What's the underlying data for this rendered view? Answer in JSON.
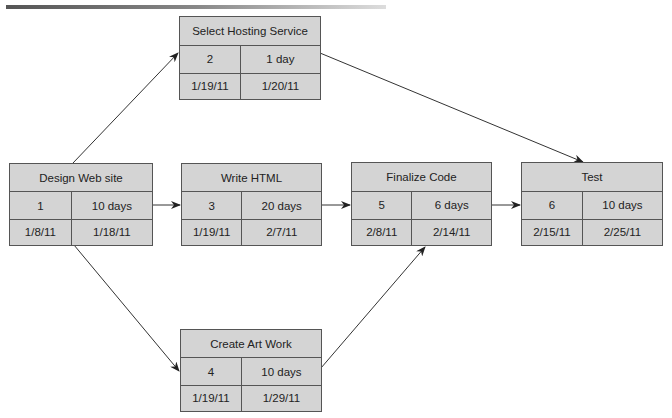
{
  "diagram": {
    "type": "network-diagram",
    "nodes": [
      {
        "id": "design",
        "title": "Design Web site",
        "task": "1",
        "duration": "10 days",
        "start": "1/8/11",
        "end": "1/18/11"
      },
      {
        "id": "hosting",
        "title": "Select Hosting Service",
        "task": "2",
        "duration": "1 day",
        "start": "1/19/11",
        "end": "1/20/11"
      },
      {
        "id": "html",
        "title": "Write HTML",
        "task": "3",
        "duration": "20 days",
        "start": "1/19/11",
        "end": "2/7/11"
      },
      {
        "id": "art",
        "title": "Create Art Work",
        "task": "4",
        "duration": "10 days",
        "start": "1/19/11",
        "end": "1/29/11"
      },
      {
        "id": "finalize",
        "title": "Finalize Code",
        "task": "5",
        "duration": "6 days",
        "start": "2/8/11",
        "end": "2/14/11"
      },
      {
        "id": "test",
        "title": "Test",
        "task": "6",
        "duration": "10 days",
        "start": "2/15/11",
        "end": "2/25/11"
      }
    ],
    "edges": [
      {
        "from": "design",
        "to": "hosting"
      },
      {
        "from": "design",
        "to": "html"
      },
      {
        "from": "design",
        "to": "art"
      },
      {
        "from": "hosting",
        "to": "test"
      },
      {
        "from": "html",
        "to": "finalize"
      },
      {
        "from": "art",
        "to": "finalize"
      },
      {
        "from": "finalize",
        "to": "test"
      }
    ]
  }
}
